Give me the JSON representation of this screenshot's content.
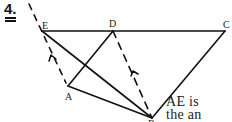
{
  "problem": {
    "number": "4."
  },
  "points": {
    "E": {
      "label": "E",
      "x": 42,
      "y": 31
    },
    "D": {
      "label": "D",
      "x": 113,
      "y": 31
    },
    "C": {
      "label": "C",
      "x": 225,
      "y": 31
    },
    "A": {
      "label": "A",
      "x": 68,
      "y": 87
    },
    "B": {
      "label": "B",
      "x": 152,
      "y": 119
    }
  },
  "segments": {
    "solid": [
      [
        "E",
        "C"
      ],
      [
        "E",
        "B"
      ],
      [
        "A",
        "B"
      ],
      [
        "A",
        "D"
      ],
      [
        "C",
        "B"
      ]
    ],
    "dashed": [
      [
        "top",
        "A"
      ],
      [
        "D",
        "B"
      ]
    ]
  },
  "text": {
    "line1": "AE is",
    "line2": "the an",
    "line3": "arro"
  },
  "colors": {
    "ink": "#111111",
    "background": "#ffffff"
  }
}
